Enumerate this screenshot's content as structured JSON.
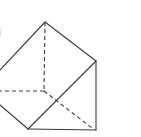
{
  "diagram": {
    "type": "triangular-prism",
    "stroke_color": "#3a3a3a",
    "cropped_label_fragment": ")",
    "vertices": {
      "top": [
        45,
        22
      ],
      "right_top": [
        96,
        61
      ],
      "right_bottom": [
        96,
        130
      ],
      "front_bottom": [
        28,
        129
      ],
      "hidden_back": [
        44,
        91
      ]
    },
    "solid_edges": [
      [
        [
          45,
          22
        ],
        [
          96,
          61
        ]
      ],
      [
        [
          45,
          22
        ],
        [
          0,
          70
        ]
      ],
      [
        [
          96,
          61
        ],
        [
          96,
          130
        ]
      ],
      [
        [
          96,
          61
        ],
        [
          28,
          129
        ]
      ],
      [
        [
          28,
          129
        ],
        [
          96,
          130
        ]
      ],
      [
        [
          0,
          105
        ],
        [
          28,
          129
        ]
      ]
    ],
    "dashed_edges": [
      [
        [
          45,
          22
        ],
        [
          44,
          91
        ]
      ],
      [
        [
          44,
          91
        ],
        [
          0,
          91
        ]
      ],
      [
        [
          44,
          91
        ],
        [
          92,
          128
        ]
      ]
    ]
  }
}
